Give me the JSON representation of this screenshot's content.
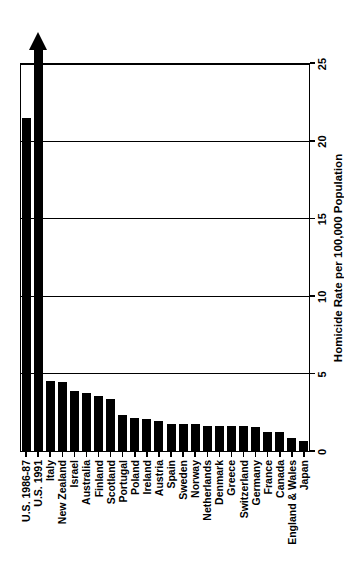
{
  "chart_data": {
    "type": "bar",
    "title": "",
    "subtitle": "",
    "orientation": "vertical-rotated",
    "xlabel": "",
    "ylabel": "Homicide Rate per 100,000 Population",
    "ylim": [
      0,
      25
    ],
    "yticks": [
      0,
      5,
      10,
      15,
      20,
      25
    ],
    "ytick_labels": [
      "0",
      "5",
      "10",
      "15",
      "20",
      "25"
    ],
    "grid": "horizontal-at-major-ticks",
    "legend": "none",
    "bar_color": "#000000",
    "categories": [
      "U.S. 1986-87",
      "U.S. 1991",
      "Italy",
      "New Zealand",
      "Israel",
      "Australia",
      "Finland",
      "Scotland",
      "Portugal",
      "Poland",
      "Ireland",
      "Austria",
      "Spain",
      "Sweden",
      "Norway",
      "Netherlands",
      "Denmark",
      "Greece",
      "Switzerland",
      "Germany",
      "France",
      "Canada",
      "England & Wales",
      "Japan"
    ],
    "values": [
      21.5,
      25.5,
      4.6,
      4.5,
      3.9,
      3.8,
      3.6,
      3.4,
      2.4,
      2.2,
      2.1,
      2.0,
      1.8,
      1.8,
      1.8,
      1.7,
      1.7,
      1.7,
      1.7,
      1.6,
      1.3,
      1.3,
      0.9,
      0.7
    ],
    "annotations": [
      {
        "category": "U.S. 1991",
        "note": "bar extends beyond axis maximum; drawn with arrowhead indicating off-scale value",
        "off_scale": true
      }
    ]
  },
  "axis": {
    "value_axis_title": "Homicide Rate per 100,000 Population"
  }
}
